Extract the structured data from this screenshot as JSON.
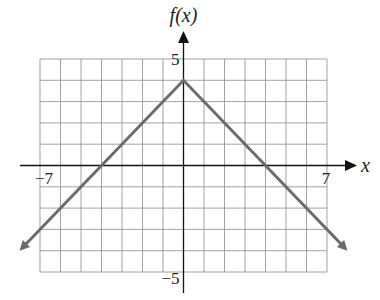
{
  "chart_data": {
    "type": "line",
    "title": "",
    "xlabel": "x",
    "ylabel": "f(x)",
    "xlim": [
      -7,
      7
    ],
    "ylim": [
      -5,
      5
    ],
    "grid": true,
    "tick_labels": {
      "x": [
        {
          "value": -7,
          "label": "−7"
        },
        {
          "value": 7,
          "label": "7"
        }
      ],
      "y": [
        {
          "value": 5,
          "label": "5"
        },
        {
          "value": -5,
          "label": "−5"
        }
      ]
    },
    "series": [
      {
        "name": "f(x)",
        "x": [
          -8,
          0,
          8
        ],
        "y": [
          -4,
          4,
          -4
        ],
        "vertex": [
          0,
          4
        ],
        "arrows_at_ends": true,
        "color": "#6b6b6b"
      }
    ]
  }
}
